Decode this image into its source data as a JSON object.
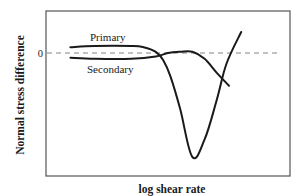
{
  "chart_data": {
    "type": "line",
    "title": "",
    "xlabel": "log shear rate",
    "ylabel": "Normal stress difference",
    "xlim": [
      0,
      1
    ],
    "ylim": [
      -1,
      0.4
    ],
    "grid": false,
    "legend": "none (curves labeled inline)",
    "reference_lines": [
      {
        "axis": "y",
        "value": 0,
        "style": "dashed",
        "label": "0"
      }
    ],
    "y_tick_labels": [
      {
        "value": 0,
        "label": "0"
      }
    ],
    "series": [
      {
        "name": "Primary",
        "label": "Primary",
        "color": "#1a1a1a",
        "x": [
          0.1,
          0.2,
          0.35,
          0.4,
          0.45,
          0.48,
          0.51,
          0.55,
          0.6,
          0.65,
          0.7,
          0.74,
          0.8
        ],
        "y": [
          0.05,
          0.06,
          0.06,
          0.05,
          0.01,
          -0.06,
          -0.2,
          -0.48,
          -0.89,
          -0.74,
          -0.4,
          -0.09,
          0.18
        ]
      },
      {
        "name": "Secondary",
        "label": "Secondary",
        "color": "#1a1a1a",
        "x": [
          0.1,
          0.2,
          0.35,
          0.45,
          0.5,
          0.55,
          0.6,
          0.65,
          0.7,
          0.75
        ],
        "y": [
          -0.04,
          -0.05,
          -0.05,
          -0.03,
          0.0,
          0.01,
          0.01,
          -0.05,
          -0.17,
          -0.28
        ]
      }
    ]
  }
}
